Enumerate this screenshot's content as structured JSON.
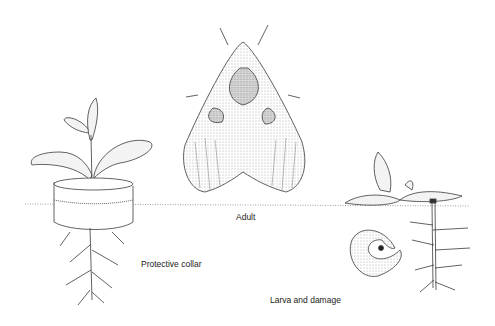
{
  "diagram": {
    "labels": {
      "adult": "Adult",
      "collar": "Protective collar",
      "larva": "Larva and damage"
    },
    "colors": {
      "ink": "#3a3a3a",
      "shade": "#9a9a9a",
      "background": "#ffffff"
    }
  }
}
